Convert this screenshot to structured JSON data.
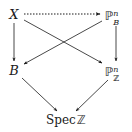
{
  "diagram": {
    "type": "commutative-diagram",
    "nodes": [
      {
        "id": "X",
        "label": "X",
        "x": 14,
        "y": 14
      },
      {
        "id": "PB",
        "base": "ℙ",
        "sup": "n",
        "sub": "B",
        "x": 112,
        "y": 14
      },
      {
        "id": "B",
        "label": "B",
        "x": 14,
        "y": 70
      },
      {
        "id": "PZ",
        "base": "ℙ",
        "sup": "n",
        "sub": "ℤ",
        "x": 112,
        "y": 70
      },
      {
        "id": "SpecZ",
        "word": "Spec",
        "ring": "ℤ",
        "x": 66,
        "y": 119
      }
    ],
    "edges": [
      {
        "from": "X",
        "to": "PB",
        "style": "dotted"
      },
      {
        "from": "X",
        "to": "B",
        "style": "solid"
      },
      {
        "from": "X",
        "to": "PZ",
        "style": "solid"
      },
      {
        "from": "PB",
        "to": "B",
        "style": "solid"
      },
      {
        "from": "PB",
        "to": "PZ",
        "style": "solid"
      },
      {
        "from": "B",
        "to": "SpecZ",
        "style": "solid"
      },
      {
        "from": "PZ",
        "to": "SpecZ",
        "style": "solid"
      }
    ],
    "colors": {
      "ink": "#1a1a1a",
      "background": "#ffffff"
    }
  }
}
